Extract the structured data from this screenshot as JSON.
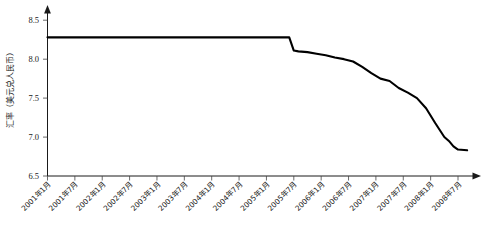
{
  "chart_data": {
    "type": "line",
    "title": "",
    "subtitle": "",
    "xlabel": "",
    "ylabel": "汇率（美元兑人民币）",
    "ylim": [
      6.5,
      8.75
    ],
    "yticks": [
      6.5,
      7.0,
      7.5,
      8.0,
      8.5
    ],
    "ytick_labels": [
      "6.5",
      "7.0",
      "7.5",
      "8.0",
      "8.5"
    ],
    "grid": false,
    "legend": null,
    "legend_position": "none",
    "xlim_labels": [
      "2001年1月",
      "2008年7月"
    ],
    "categories": [
      "2001年1月",
      "2001年7月",
      "2002年1月",
      "2002年7月",
      "2003年1月",
      "2003年7月",
      "2004年1月",
      "2004年7月",
      "2005年1月",
      "2005年7月",
      "2006年1月",
      "2006年7月",
      "2007年1月",
      "2007年7月",
      "2008年1月",
      "2008年7月"
    ],
    "series": [
      {
        "name": "美元兑人民币汇率",
        "color": "#000000",
        "x": [
          "2001-01",
          "2001-07",
          "2002-01",
          "2002-07",
          "2003-01",
          "2003-07",
          "2004-01",
          "2004-07",
          "2005-01",
          "2005-06",
          "2005-07",
          "2005-08",
          "2005-10",
          "2005-12",
          "2006-02",
          "2006-04",
          "2006-06",
          "2006-08",
          "2006-10",
          "2006-12",
          "2007-02",
          "2007-04",
          "2007-06",
          "2007-08",
          "2007-10",
          "2007-12",
          "2008-02",
          "2008-04",
          "2008-05",
          "2008-06",
          "2008-07",
          "2008-09"
        ],
        "values": [
          8.28,
          8.28,
          8.28,
          8.28,
          8.28,
          8.28,
          8.28,
          8.28,
          8.28,
          8.28,
          8.11,
          8.1,
          8.09,
          8.07,
          8.05,
          8.02,
          8.0,
          7.97,
          7.9,
          7.82,
          7.75,
          7.72,
          7.63,
          7.57,
          7.5,
          7.37,
          7.18,
          7.0,
          6.95,
          6.88,
          6.84,
          6.83
        ]
      }
    ],
    "annotations": [
      {
        "text": "2005年7月汇改：8.28 降至 8.11",
        "x": "2005-07",
        "y": 8.11,
        "visible": false
      }
    ],
    "axis_arrows": {
      "y_axis": "up",
      "x_axis": "right"
    }
  }
}
